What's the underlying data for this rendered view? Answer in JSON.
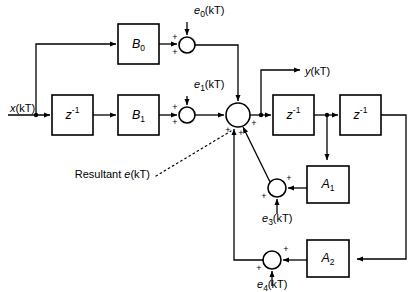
{
  "figure": {
    "type": "block-diagram",
    "background": "#ffffff",
    "line_color": "#000000",
    "width": 416,
    "height": 292
  },
  "blocks": [
    {
      "id": "b0",
      "label": "B",
      "sub": "0",
      "sup": "",
      "x": 118,
      "y": 24,
      "w": 41,
      "h": 40
    },
    {
      "id": "z1",
      "label": "z",
      "sub": "",
      "sup": "-1",
      "x": 52,
      "y": 95,
      "w": 41,
      "h": 40
    },
    {
      "id": "b1",
      "label": "B",
      "sub": "1",
      "sup": "",
      "x": 118,
      "y": 95,
      "w": 41,
      "h": 40
    },
    {
      "id": "z2",
      "label": "z",
      "sub": "",
      "sup": "-1",
      "x": 273,
      "y": 95,
      "w": 41,
      "h": 40
    },
    {
      "id": "z3",
      "label": "z",
      "sub": "",
      "sup": "-1",
      "x": 340,
      "y": 95,
      "w": 41,
      "h": 40
    },
    {
      "id": "a1",
      "label": "A",
      "sub": "1",
      "sup": "",
      "x": 307,
      "y": 166,
      "w": 42,
      "h": 37
    },
    {
      "id": "a2",
      "label": "A",
      "sub": "2",
      "sup": "",
      "x": 307,
      "y": 240,
      "w": 42,
      "h": 37
    }
  ],
  "summers": [
    {
      "id": "s0",
      "cx": 187,
      "cy": 45,
      "r": 8
    },
    {
      "id": "s1",
      "cx": 187,
      "cy": 115,
      "r": 8
    },
    {
      "id": "smain",
      "cx": 238,
      "cy": 115,
      "r": 12
    },
    {
      "id": "s3",
      "cx": 277,
      "cy": 188,
      "r": 9
    },
    {
      "id": "s4",
      "cx": 272,
      "cy": 260,
      "r": 9
    }
  ],
  "signals": {
    "input": {
      "text": "x(kT)",
      "base": "x",
      "arg": "(kT)",
      "x": 10,
      "y": 112
    },
    "output": {
      "text": "y(kT)",
      "base": "y",
      "arg": "(kT)",
      "x": 305,
      "y": 75
    },
    "e0": {
      "text": "e0(kT)",
      "base": "e",
      "sub": "0",
      "arg": "(kT)",
      "x": 194,
      "y": 14
    },
    "e1": {
      "text": "e1(kT)",
      "base": "e",
      "sub": "1",
      "arg": "(kT)",
      "x": 194,
      "y": 88
    },
    "e3": {
      "text": "e3(kT)",
      "base": "e",
      "sub": "3",
      "arg": "(kT)",
      "x": 262,
      "y": 222
    },
    "e4": {
      "text": "e4(kT)",
      "base": "e",
      "sub": "4",
      "arg": "(kT)",
      "x": 257,
      "y": 288
    }
  },
  "annotation": {
    "resultant_prefix": "Resultant ",
    "resultant_symbol": "e",
    "resultant_arg": "(kT)",
    "x": 150,
    "y": 178
  },
  "sign_marks": {
    "plus": "+"
  }
}
